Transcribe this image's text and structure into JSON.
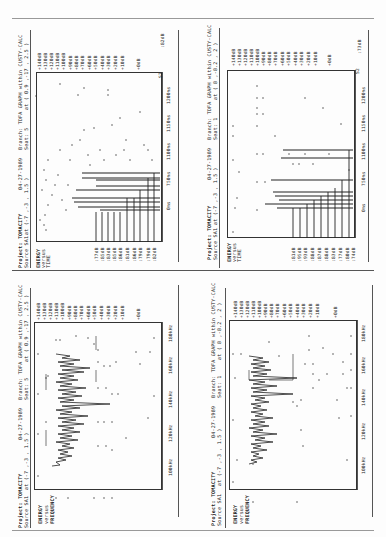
{
  "page": {
    "layout": "2x2 rotated plot panels (scanned document)",
    "orientation": "landscape content rotated 90deg counter-clockwise"
  },
  "panels": [
    {
      "id": "top-left",
      "header_line1": "Project: TOMACITY",
      "header_line2": "Source SA1",
      "date": "04-27-1989",
      "coords1": "at (-7 ,-3 , 1.5 )",
      "branch": "Branch: TDFA GRAPH within CUSTY-CALC",
      "seat": "Seat: 5",
      "coords2": "at ( 0.9 ,-17 , 2.5 )",
      "title_lines": [
        "ENERGY",
        "versus",
        "TIME"
      ],
      "y_ticks": [
        "+140dB",
        "+130dB",
        "+120dB",
        "+110dB",
        "+100dB",
        "+90dB",
        "+80dB",
        "+70dB",
        "+60dB",
        "+50dB",
        "+40dB",
        "+30dB",
        "+20dB",
        "+10dB",
        "+0dB"
      ],
      "x_ticks": [
        "0ms",
        "750ms",
        "1100ms",
        "1150ms",
        "1200ms"
      ],
      "source_labels": [
        "SA1",
        "S1",
        "F1",
        "P1",
        "S2",
        "S3",
        "S4",
        "S3",
        "F2",
        "P2"
      ],
      "source_values": [
        ":77dB",
        ":85dB",
        ":83dB",
        ":85dB",
        ":86dB",
        ":81dB",
        ":86dB",
        ":79dB",
        ":79dB",
        ":82dB"
      ],
      "corner_label": "S2",
      "corner_value": ":82dB"
    },
    {
      "id": "top-right",
      "header_line1": "Project: TOMACITY",
      "header_line2": "Source SA1",
      "date": "04-27-1989",
      "coords1": "at (-7 ,-3 , 1.5 )",
      "branch": "Branch: TDFA GRAPH within CUSTY-CALC",
      "seat": "Seat: 1",
      "coords2": "at ( 8 ,-8.2 , 2 )",
      "title_lines": [
        "ENERGY",
        "versus",
        "TIME"
      ],
      "y_ticks": [
        "+140dB",
        "+130dB",
        "+120dB",
        "+110dB",
        "+100dB",
        "+90dB",
        "+80dB",
        "+70dB",
        "+60dB",
        "+50dB",
        "+40dB",
        "+30dB",
        "+20dB",
        "+10dB",
        "+0dB"
      ],
      "x_ticks": [
        "0ms",
        "750ms",
        "1100ms",
        "1150ms",
        "1200ms"
      ],
      "source_labels": [
        "SA1",
        "S1",
        "S2",
        "F1",
        "P1",
        "F3",
        "S3",
        "F3",
        "F1",
        "P2"
      ],
      "source_values": [
        ":81dB",
        ":95dB",
        ":93dB",
        ":88dB",
        ":87dB",
        ":88dB",
        ":83dB",
        ":77dB",
        ":80dB",
        ":74dB"
      ],
      "corner_label": "S2",
      "corner_value": ":73dB"
    },
    {
      "id": "bottom-left",
      "header_line1": "Project: TOMACITY",
      "header_line2": "Source SA1",
      "date": "04-27-1989",
      "coords1": "at (-7 ,-3 , 1.5 )",
      "branch": "Branch: TDFA GRAPH within CUSTY-CALC",
      "seat": "Seat: 5",
      "coords2": "at ( 0.9 ,-17 , 2.5 )",
      "title_lines": [
        "ENERGY",
        "versus",
        "FREQUENCY"
      ],
      "y_ticks": [
        "+140dB",
        "+130dB",
        "+120dB",
        "+110dB",
        "+100dB",
        "+90dB",
        "+80dB",
        "+70dB",
        "+60dB",
        "+50dB",
        "+40dB",
        "+30dB",
        "+20dB",
        "+10dB",
        "+0dB"
      ],
      "x_ticks": [
        "100kHz",
        "120kHz",
        "140kHz",
        "160kHz",
        "180kHz"
      ]
    },
    {
      "id": "bottom-right",
      "header_line1": "Project: TOMACITY",
      "header_line2": "Source SA1",
      "date": "04-27-1989",
      "coords1": "at (-7 ,-3 , 1.5 )",
      "branch": "Branch: TDFA GRAPH within CUSTY-CALC",
      "seat": "Seat: 1",
      "coords2": "at ( 8 ,-8.2 , 2 )",
      "title_lines": [
        "ENERGY",
        "versus",
        "FREQUENCY"
      ],
      "y_ticks": [
        "+140dB",
        "+130dB",
        "+120dB",
        "+110dB",
        "+100dB",
        "+90dB",
        "+80dB",
        "+70dB",
        "+60dB",
        "+50dB",
        "+40dB",
        "+30dB",
        "+20dB",
        "+10dB",
        "+0dB"
      ],
      "x_ticks": [
        "100kHz",
        "120kHz",
        "140kHz",
        "160kHz",
        "180kHz"
      ]
    }
  ]
}
